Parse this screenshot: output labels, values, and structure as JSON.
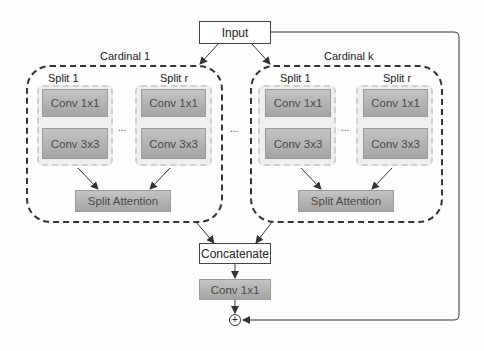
{
  "diagram": {
    "input": {
      "label": "Input"
    },
    "cardinals": [
      {
        "label": "Cardinal 1",
        "splits": [
          {
            "label": "Split 1",
            "conv_top": "Conv 1x1",
            "conv_bottom": "Conv 3x3"
          },
          {
            "label": "Split r",
            "conv_top": "Conv 1x1",
            "conv_bottom": "Conv 3x3"
          }
        ],
        "splits_ellipsis": "...",
        "attention": "Split Attention"
      },
      {
        "label": "Cardinal k",
        "splits": [
          {
            "label": "Split 1",
            "conv_top": "Conv 1x1",
            "conv_bottom": "Conv 3x3"
          },
          {
            "label": "Split r",
            "conv_top": "Conv 1x1",
            "conv_bottom": "Conv 3x3"
          }
        ],
        "splits_ellipsis": "...",
        "attention": "Split Attention"
      }
    ],
    "cardinals_ellipsis": "...",
    "concatenate": "Concatenate",
    "final_conv": "Conv 1x1",
    "add_symbol": "+",
    "colors": {
      "conv_gradient_top": "#c4c4c4",
      "conv_gradient_bottom": "#a4a4a4",
      "split_bg": "#efefef",
      "line": "#333333"
    }
  }
}
